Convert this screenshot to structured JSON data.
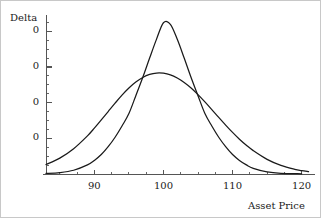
{
  "chart_data": {
    "type": "line",
    "title": "",
    "xlabel": "Asset Price",
    "ylabel": "Delta",
    "xlim": [
      83,
      121.5
    ],
    "ylim": [
      0,
      0.088
    ],
    "grid": false,
    "legend": false,
    "x_ticks": [
      {
        "value": 90,
        "label": "90"
      },
      {
        "value": 100,
        "label": "100"
      },
      {
        "value": 110,
        "label": "110"
      },
      {
        "value": 120,
        "label": "120"
      }
    ],
    "y_ticks": [
      {
        "value": 0.08,
        "label": "0"
      },
      {
        "value": 0.06,
        "label": "0"
      },
      {
        "value": 0.04,
        "label": "0"
      },
      {
        "value": 0.02,
        "label": "0"
      }
    ],
    "x_minor_tick_count": 4,
    "y_minor_tick_count": 4,
    "line_color": "#1a1a1a",
    "axis_color": "#555555",
    "series": [
      {
        "name": "narrow-peak-delta",
        "description": "tall narrow bell curve peaking at asset price 100",
        "peak_x": 100,
        "peak_y": 0.0855,
        "sigma": 4.15,
        "x": [
          83,
          85,
          87,
          89,
          90,
          91,
          92,
          93,
          94,
          95,
          96,
          97,
          98,
          99,
          100,
          101,
          102,
          103,
          104,
          105,
          106,
          107,
          108,
          109,
          110,
          111,
          112,
          113,
          115,
          117,
          120
        ],
        "values": [
          0.0003,
          0.0008,
          0.0021,
          0.0051,
          0.0076,
          0.0109,
          0.0153,
          0.0206,
          0.0269,
          0.0339,
          0.0439,
          0.0541,
          0.065,
          0.0756,
          0.0848,
          0.0839,
          0.0755,
          0.065,
          0.0541,
          0.0439,
          0.0339,
          0.0269,
          0.0206,
          0.0153,
          0.0109,
          0.0076,
          0.0051,
          0.0032,
          0.0012,
          0.0004,
          0.0001
        ]
      },
      {
        "name": "wide-peak-delta",
        "description": "lower broad bell curve peaking at asset price 100",
        "peak_x": 100,
        "peak_y": 0.0565,
        "sigma": 6.6,
        "x": [
          83,
          85,
          87,
          89,
          90,
          91,
          92,
          93,
          94,
          95,
          96,
          97,
          98,
          99,
          100,
          101,
          102,
          103,
          104,
          105,
          106,
          107,
          108,
          109,
          110,
          111,
          112,
          113,
          115,
          117,
          119,
          120,
          121
        ],
        "values": [
          0.0053,
          0.0089,
          0.0142,
          0.0214,
          0.0257,
          0.0303,
          0.035,
          0.0397,
          0.0442,
          0.0482,
          0.0515,
          0.0541,
          0.0558,
          0.0566,
          0.0565,
          0.0556,
          0.0538,
          0.0513,
          0.0482,
          0.0445,
          0.0404,
          0.0361,
          0.0317,
          0.0274,
          0.0233,
          0.0195,
          0.0161,
          0.0131,
          0.0082,
          0.0048,
          0.0026,
          0.0019,
          0.0013
        ]
      }
    ]
  },
  "labels": {
    "y_axis_title": "Delta",
    "x_axis_title": "Asset Price"
  }
}
